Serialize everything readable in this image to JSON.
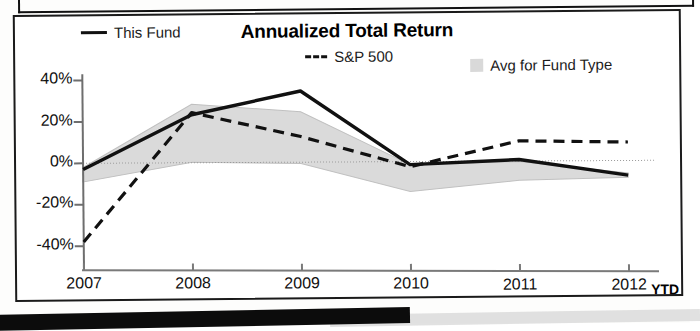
{
  "chart_data": {
    "type": "line",
    "title": "Annualized Total Return",
    "xlabel": "",
    "ylabel": "",
    "grid": false,
    "legend_position": "top",
    "x": [
      "2007",
      "2008",
      "2009",
      "2010",
      "2011",
      "2012"
    ],
    "categories": [
      "2007",
      "2008",
      "2009",
      "2010",
      "2011",
      "2012"
    ],
    "xtick_labels": [
      "2007",
      "2008",
      "2009",
      "2010",
      "2011",
      "2012"
    ],
    "x_axis_suffix": "YTD",
    "ytick_labels": [
      "40%",
      "20%",
      "0%",
      "-20%",
      "-40%"
    ],
    "ytick_values": [
      40,
      20,
      0,
      -20,
      -40
    ],
    "ylim": [
      -42,
      42
    ],
    "series": [
      {
        "name": "This Fund",
        "style": "solid",
        "color": "#111111",
        "values": [
          -3,
          23,
          34,
          -2,
          0,
          -8
        ]
      },
      {
        "name": "S&P 500",
        "style": "dashed",
        "color": "#111111",
        "values": [
          -38,
          24,
          12,
          -3,
          9,
          8
        ]
      }
    ],
    "band": {
      "name": "Avg for Fund Type",
      "color": "#d9d9d9",
      "upper": [
        -2,
        28,
        24,
        -2,
        -1,
        -7
      ],
      "lower": [
        -9,
        0,
        -1,
        -15,
        -10,
        -9
      ]
    },
    "annotations": []
  },
  "header": {
    "title": "Annualized Total Return"
  },
  "legend": {
    "items": [
      {
        "label": "This Fund",
        "marker": "solid-line-swatch"
      },
      {
        "label": "S&P 500",
        "marker": "dashed-line-swatch"
      },
      {
        "label": "Avg for Fund Type",
        "marker": "gray-band-swatch"
      }
    ]
  },
  "axes": {
    "y_labels": [
      "40%",
      "20%",
      "0%",
      "-20%",
      "-40%"
    ],
    "x_labels": [
      "2007",
      "2008",
      "2009",
      "2010",
      "2011",
      "2012"
    ],
    "x_suffix": "YTD"
  }
}
